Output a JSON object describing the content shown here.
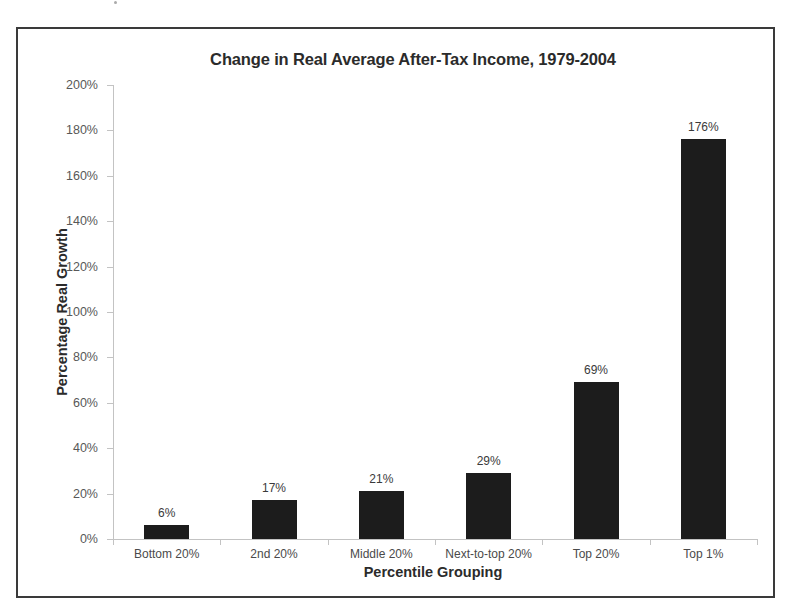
{
  "chart_data": {
    "type": "bar",
    "title": "Change in Real Average After-Tax Income, 1979-2004",
    "xlabel": "Percentile Grouping",
    "ylabel": "Percentage Real Growth",
    "categories": [
      "Bottom 20%",
      "2nd 20%",
      "Middle 20%",
      "Next-to-top 20%",
      "Top 20%",
      "Top 1%"
    ],
    "values": [
      6,
      17,
      21,
      29,
      69,
      176
    ],
    "value_labels": [
      "6%",
      "17%",
      "21%",
      "29%",
      "69%",
      "176%"
    ],
    "ylim": [
      0,
      200
    ],
    "ytick_values": [
      0,
      20,
      40,
      60,
      80,
      100,
      120,
      140,
      160,
      180,
      200
    ],
    "ytick_labels": [
      "0%",
      "20%",
      "40%",
      "60%",
      "80%",
      "100%",
      "120%",
      "140%",
      "160%",
      "180%",
      "200%"
    ],
    "grid": false,
    "legend": "none",
    "bar_color": "#1c1c1c",
    "axis_color": "#c3c3c3",
    "frame_color": "#3a3a3a",
    "background": "#ffffff"
  }
}
